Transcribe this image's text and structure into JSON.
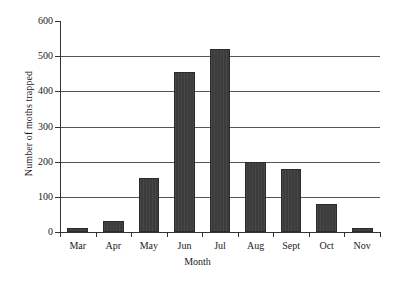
{
  "chart_data": {
    "type": "bar",
    "title": "",
    "xlabel": "Month",
    "ylabel": "Number of moths trapped",
    "categories": [
      "Mar",
      "Apr",
      "May",
      "Jun",
      "Jul",
      "Aug",
      "Sept",
      "Oct",
      "Nov"
    ],
    "values": [
      12,
      32,
      155,
      455,
      520,
      200,
      178,
      80,
      10
    ],
    "ylim": [
      0,
      600
    ],
    "ytick_labels": [
      "0",
      "100",
      "200",
      "300",
      "400",
      "500",
      "600"
    ],
    "ytick_values": [
      0,
      100,
      200,
      300,
      400,
      500,
      600
    ],
    "grid": "horizontal",
    "legend": "none",
    "bar_color": "#3c3c3c",
    "axis_color": "#333333",
    "gridline_color": "#555555",
    "background_color": "#ffffff"
  }
}
